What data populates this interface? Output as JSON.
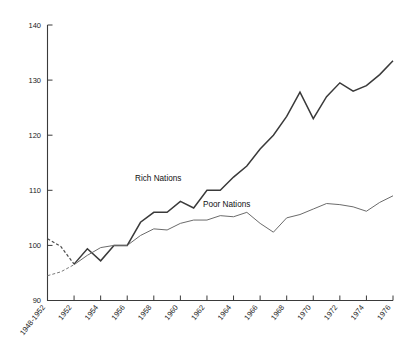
{
  "chart_data": {
    "type": "line",
    "title": "",
    "subtitle": "",
    "xlabel": "",
    "ylabel": "",
    "xlim": [
      0,
      13
    ],
    "ylim": [
      90,
      140
    ],
    "yticks": [
      "90",
      "100",
      "110",
      "120",
      "130",
      "140"
    ],
    "ytick_values": [
      90,
      100,
      110,
      120,
      130,
      140
    ],
    "grid": false,
    "legend_position": "inline-annotation",
    "categories": [
      "1948-1952",
      "1952",
      "1954",
      "1956",
      "1958",
      "1960",
      "1962",
      "1964",
      "1966",
      "1968",
      "1970",
      "1972",
      "1974",
      "1976"
    ],
    "series": [
      {
        "name": "Rich Nations",
        "color": "#3a3a3a",
        "x": [
          0,
          0.5,
          1,
          1.5,
          2,
          2.5,
          3,
          3.5,
          4,
          4.5,
          5,
          5.5,
          6,
          6.5,
          7,
          7.5,
          8,
          8.5,
          9,
          9.5,
          10,
          10.5,
          11,
          11.5,
          12,
          12.5,
          13
        ],
        "values": [
          101.2,
          99.8,
          96.6,
          99.4,
          97.2,
          100.0,
          100.0,
          104.2,
          106.0,
          106.0,
          108.0,
          106.8,
          110.0,
          110.0,
          112.4,
          114.4,
          117.5,
          120.0,
          123.4,
          127.8,
          123.0,
          127.0,
          129.5,
          128.0,
          129.0,
          131.0,
          133.5
        ]
      },
      {
        "name": "Poor Nations",
        "color": "#6b6b6b",
        "x": [
          0,
          0.5,
          1,
          1.5,
          2,
          2.5,
          3,
          3.5,
          4,
          4.5,
          5,
          5.5,
          6,
          6.5,
          7,
          7.5,
          8,
          8.5,
          9,
          9.5,
          10,
          10.5,
          11,
          11.5,
          12,
          12.5,
          13
        ],
        "values": [
          94.5,
          95.2,
          96.5,
          98.2,
          99.6,
          100.0,
          100.0,
          101.8,
          103.0,
          102.8,
          104.0,
          104.6,
          104.6,
          105.4,
          105.2,
          106.0,
          104.0,
          102.4,
          105.0,
          105.6,
          106.6,
          107.6,
          107.4,
          107.0,
          106.2,
          107.8,
          109.0
        ]
      }
    ],
    "annotations": [
      {
        "text": "Rich Nations",
        "x_px": 135,
        "y_px": 178
      },
      {
        "text": "Poor Nations",
        "x_px": 203,
        "y_px": 204
      }
    ],
    "axis_color": "#3a3a3a",
    "background": "#ffffff"
  },
  "axes": {
    "y_labels": [
      "140",
      "130",
      "120",
      "110",
      "100",
      "90"
    ],
    "x_labels": [
      "1948-1952",
      "1952",
      "1954",
      "1956",
      "1958",
      "1960",
      "1962",
      "1964",
      "1966",
      "1968",
      "1970",
      "1972",
      "1974",
      "1976"
    ]
  },
  "labels": {
    "rich": "Rich Nations",
    "poor": "Poor Nations"
  }
}
